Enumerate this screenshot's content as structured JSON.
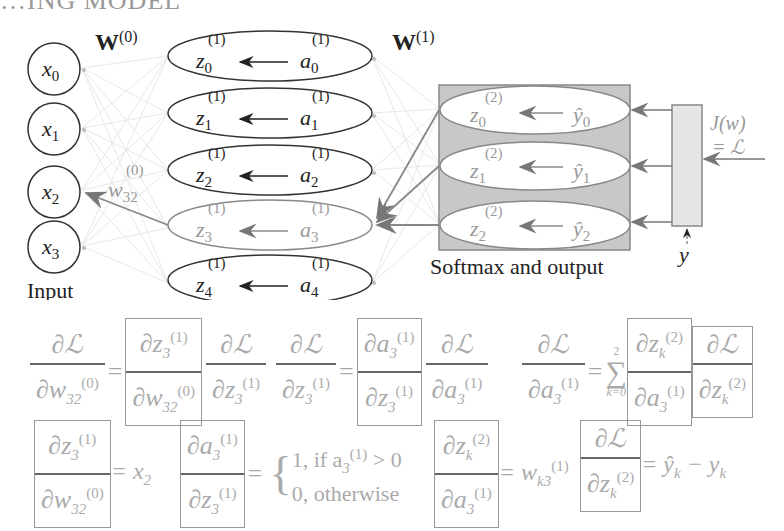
{
  "header": {
    "partial_title": "…ING MODEL"
  },
  "network": {
    "weights": [
      {
        "label": "W",
        "sup": "(0)"
      },
      {
        "label": "W",
        "sup": "(1)"
      }
    ],
    "inputs": [
      {
        "var": "x",
        "sub": "0"
      },
      {
        "var": "x",
        "sub": "1"
      },
      {
        "var": "x",
        "sub": "2"
      },
      {
        "var": "x",
        "sub": "3"
      }
    ],
    "input_label": "Input",
    "hidden": [
      {
        "z": "z",
        "a": "a",
        "sub": "0",
        "sup": "(1)",
        "highlight": false
      },
      {
        "z": "z",
        "a": "a",
        "sub": "1",
        "sup": "(1)",
        "highlight": false
      },
      {
        "z": "z",
        "a": "a",
        "sub": "2",
        "sup": "(1)",
        "highlight": false
      },
      {
        "z": "z",
        "a": "a",
        "sub": "3",
        "sup": "(1)",
        "highlight": true
      },
      {
        "z": "z",
        "a": "a",
        "sub": "4",
        "sup": "(1)",
        "highlight": false
      }
    ],
    "output": [
      {
        "z": "z",
        "y": "ŷ",
        "sub": "0",
        "sup": "(2)"
      },
      {
        "z": "z",
        "y": "ŷ",
        "sub": "1",
        "sup": "(2)"
      },
      {
        "z": "z",
        "y": "ŷ",
        "sub": "2",
        "sup": "(2)"
      }
    ],
    "output_label": "Softmax and output",
    "highlighted_weight": {
      "var": "w",
      "sub": "32",
      "sup": "(0)"
    },
    "loss_label_line1": "J(w)",
    "loss_label_line2": "= ℒ",
    "target_label": "y",
    "colors": {
      "highlight": "#888888",
      "box_fill": "#c8c8c8",
      "loss_box_fill": "#e6e6e6",
      "stroke": "#333333"
    }
  },
  "equations": {
    "row1": {
      "eq1": {
        "lhs_num": "∂ℒ",
        "lhs_den": "∂w",
        "lhs_den_sub": "32",
        "lhs_den_sup": "(0)",
        "t1_num": "∂z",
        "t1_num_sub": "3",
        "t1_num_sup": "(1)",
        "t1_den": "∂w",
        "t1_den_sub": "32",
        "t1_den_sup": "(0)",
        "t2_num": "∂ℒ",
        "t2_den": "∂z",
        "t2_den_sub": "3",
        "t2_den_sup": "(1)"
      },
      "eq2": {
        "lhs_num": "∂ℒ",
        "lhs_den": "∂z",
        "lhs_den_sub": "3",
        "lhs_den_sup": "(1)",
        "t1_num": "∂a",
        "t1_num_sub": "3",
        "t1_num_sup": "(1)",
        "t1_den": "∂z",
        "t1_den_sub": "3",
        "t1_den_sup": "(1)",
        "t2_num": "∂ℒ",
        "t2_den": "∂a",
        "t2_den_sub": "3",
        "t2_den_sup": "(1)"
      },
      "eq3": {
        "lhs_num": "∂ℒ",
        "lhs_den": "∂a",
        "lhs_den_sub": "3",
        "lhs_den_sup": "(1)",
        "sum_top": "2",
        "sum_bottom": "k=0",
        "sum_symbol": "∑",
        "t1_num": "∂z",
        "t1_num_sub": "k",
        "t1_num_sup": "(2)",
        "t1_den": "∂a",
        "t1_den_sub": "3",
        "t1_den_sup": "(1)",
        "t2_num": "∂ℒ",
        "t2_den": "∂z",
        "t2_den_sub": "k",
        "t2_den_sup": "(2)"
      }
    },
    "row2": {
      "d1": {
        "num": "∂z",
        "num_sub": "3",
        "num_sup": "(1)",
        "den": "∂w",
        "den_sub": "32",
        "den_sup": "(0)",
        "rhs": "= x",
        "rhs_sub": "2"
      },
      "d2": {
        "num": "∂a",
        "num_sub": "3",
        "num_sup": "(1)",
        "den": "∂z",
        "den_sub": "3",
        "den_sup": "(1)",
        "case1": "1, if a",
        "case1_sub": "3",
        "case1_sup": "(1)",
        "case1_tail": " > 0",
        "case2": "0, otherwise"
      },
      "d3": {
        "num": "∂z",
        "num_sub": "k",
        "num_sup": "(2)",
        "den": "∂a",
        "den_sub": "3",
        "den_sup": "(1)",
        "rhs": "= w",
        "rhs_sub": "k3",
        "rhs_sup": "(1)"
      },
      "d4": {
        "num": "∂ℒ",
        "den": "∂z",
        "den_sub": "k",
        "den_sup": "(2)",
        "rhs": "= ŷ",
        "rhs_sub": "k",
        "rhs_tail": " − y",
        "rhs_tail_sub": "k"
      }
    }
  }
}
